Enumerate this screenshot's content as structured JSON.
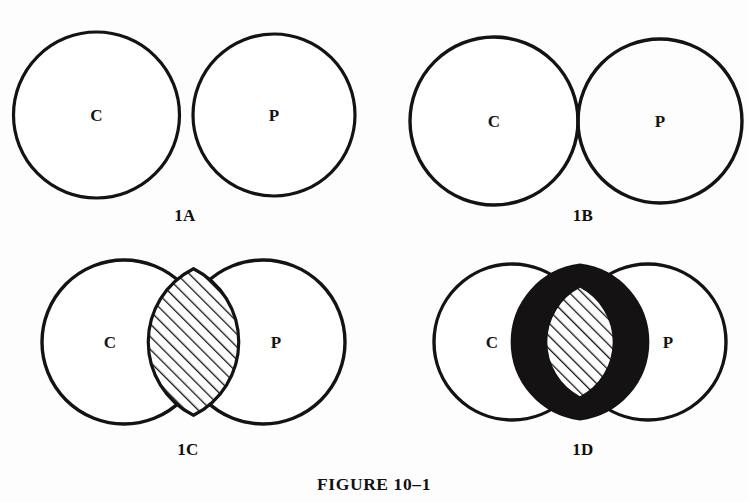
{
  "figure": {
    "caption": "FIGURE 10–1",
    "background_color": "#fdfdfd",
    "ink_color": "#141212"
  },
  "panels": [
    {
      "id": "1A",
      "label": "1A",
      "left_circle_letter": "C",
      "right_circle_letter": "P",
      "relation": "disjoint",
      "intersection_fill": "none",
      "label_x": 185,
      "label_y": 206
    },
    {
      "id": "1B",
      "label": "1B",
      "left_circle_letter": "C",
      "right_circle_letter": "P",
      "relation": "tangent",
      "intersection_fill": "none",
      "label_x": 583,
      "label_y": 206
    },
    {
      "id": "1C",
      "label": "1C",
      "left_circle_letter": "C",
      "right_circle_letter": "P",
      "relation": "overlapping",
      "intersection_fill": "hatched",
      "label_x": 188,
      "label_y": 440
    },
    {
      "id": "1D",
      "label": "1D",
      "left_circle_letter": "C",
      "right_circle_letter": "P",
      "relation": "overlapping",
      "intersection_fill": "hatched-with-black-border",
      "label_x": 583,
      "label_y": 440
    }
  ]
}
